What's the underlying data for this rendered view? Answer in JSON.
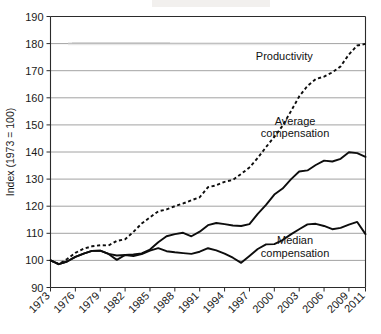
{
  "chart_data": {
    "type": "line",
    "title": "",
    "xlabel": "",
    "ylabel": "Index (1973 = 100)",
    "ylim": [
      90,
      190
    ],
    "xlim": [
      1973,
      2011
    ],
    "yticks": [
      90,
      100,
      110,
      120,
      130,
      140,
      150,
      160,
      170,
      180,
      190
    ],
    "xticks": [
      1973,
      1976,
      1979,
      1982,
      1985,
      1988,
      1991,
      1994,
      1997,
      2000,
      2003,
      2006,
      2009,
      2011
    ],
    "grid": "horizontal",
    "legend_position": "inline-annotations",
    "x": [
      1973,
      1974,
      1975,
      1976,
      1977,
      1978,
      1979,
      1980,
      1981,
      1982,
      1983,
      1984,
      1985,
      1986,
      1987,
      1988,
      1989,
      1990,
      1991,
      1992,
      1993,
      1994,
      1995,
      1996,
      1997,
      1998,
      1999,
      2000,
      2001,
      2002,
      2003,
      2004,
      2005,
      2006,
      2007,
      2008,
      2009,
      2010,
      2011
    ],
    "series": [
      {
        "name": "Productivity",
        "style": "dashed",
        "label": "Productivity",
        "values": [
          100.0,
          98.6,
          100.5,
          102.8,
          104.3,
          105.2,
          105.6,
          105.5,
          107.2,
          107.8,
          110.5,
          113.6,
          115.9,
          118.1,
          118.8,
          120.0,
          121.0,
          122.2,
          123.3,
          127.0,
          127.7,
          129.0,
          129.7,
          131.9,
          134.3,
          137.8,
          141.8,
          145.6,
          149.7,
          155.0,
          160.5,
          164.4,
          166.9,
          167.8,
          169.4,
          171.6,
          176.0,
          179.3,
          179.9
        ],
        "annotation": {
          "text": "Productivity",
          "x": 2001.2,
          "y": 174.0
        }
      },
      {
        "name": "Average compensation",
        "style": "solid",
        "label": "Average compensation",
        "values": [
          100.0,
          98.6,
          99.6,
          101.3,
          102.5,
          103.5,
          103.6,
          102.4,
          100.2,
          102.0,
          102.2,
          102.6,
          104.0,
          106.7,
          108.9,
          109.7,
          110.2,
          108.9,
          110.6,
          113.0,
          113.8,
          113.4,
          112.9,
          112.7,
          113.4,
          117.2,
          120.5,
          124.3,
          126.5,
          129.9,
          132.8,
          133.2,
          135.2,
          136.8,
          136.5,
          137.5,
          139.9,
          139.6,
          138.2
        ],
        "annotation": {
          "text": "Average\ncompensation",
          "x": 2002.5,
          "y": 150.0
        }
      },
      {
        "name": "Median compensation",
        "style": "solid",
        "label": "Median compensation",
        "values": [
          100.0,
          98.6,
          99.6,
          101.3,
          102.5,
          103.5,
          103.6,
          102.4,
          101.8,
          102.0,
          101.6,
          102.3,
          103.6,
          104.5,
          103.4,
          103.0,
          102.7,
          102.4,
          103.2,
          104.5,
          103.7,
          102.5,
          101.0,
          99.1,
          101.6,
          104.2,
          105.9,
          106.0,
          107.5,
          109.6,
          111.5,
          113.3,
          113.5,
          112.7,
          111.5,
          112.0,
          113.2,
          114.2,
          109.7
        ],
        "annotation": {
          "text": "Median\ncompensation",
          "x": 2002.5,
          "y": 106.0
        }
      }
    ]
  },
  "axis": {
    "y_title": "Index (1973 = 100)",
    "y_tick_labels": [
      "190",
      "180",
      "170",
      "160",
      "150",
      "140",
      "130",
      "120",
      "110",
      "100",
      "90"
    ],
    "x_tick_labels": [
      "1973",
      "1976",
      "1979",
      "1982",
      "1985",
      "1988",
      "1991",
      "1994",
      "1997",
      "2000",
      "2003",
      "2006",
      "2009",
      "2011"
    ]
  },
  "annotations": {
    "productivity": "Productivity",
    "average_line1": "Average",
    "average_line2": "compensation",
    "median_line1": "Median",
    "median_line2": "compensation"
  },
  "colors": {
    "line": "#0d0d0d",
    "grid": "#8a8a8a",
    "axis": "#2b2b2b",
    "background": "#ffffff"
  }
}
